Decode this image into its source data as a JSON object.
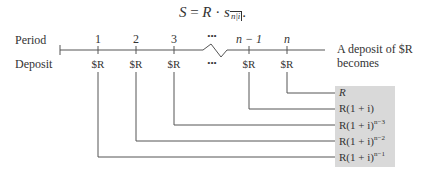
{
  "formula": {
    "lhs": "S",
    "eq": "=",
    "R": "R",
    "dot": "·",
    "s": "s",
    "sub": "n|i",
    "tail": "."
  },
  "row_labels": {
    "period": "Period",
    "deposit": "Deposit"
  },
  "periods": [
    "1",
    "2",
    "3",
    "•••",
    "n − 1",
    "n"
  ],
  "deposits": [
    "$R",
    "$R",
    "$R",
    "•••",
    "$R",
    "$R"
  ],
  "caption": {
    "line1": "A deposit of $R",
    "line2": "becomes"
  },
  "results": [
    {
      "base": "R",
      "exp": ""
    },
    {
      "base": "R(1 + i)",
      "exp": ""
    },
    {
      "base": "R(1 + i)",
      "exp": "n−3"
    },
    {
      "base": "R(1 + i)",
      "exp": "n−2"
    },
    {
      "base": "R(1 + i)",
      "exp": "n−1"
    }
  ],
  "colors": {
    "line": "#555555",
    "box": "#d9d9d9"
  }
}
